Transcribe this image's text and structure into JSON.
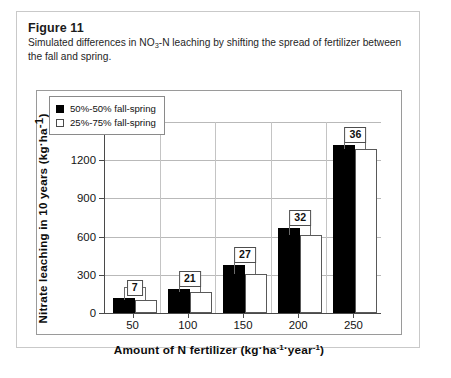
{
  "figure": {
    "title": "Figure 11",
    "caption_pre": "Simulated differences in NO",
    "caption_sub": "3",
    "caption_post": "-N leaching by shifting the spread of fertilizer between the fall and spring."
  },
  "chart_data": {
    "type": "bar",
    "title": "",
    "xlabel": "Amount of N fertilizer (kg·ha⁻¹·year⁻¹)",
    "ylabel": "Nitrate leaching in 10 years (kg·ha⁻¹)",
    "categories": [
      "50",
      "100",
      "150",
      "200",
      "250"
    ],
    "ylim": [
      0,
      1500
    ],
    "yticks": [
      0,
      300,
      600,
      900,
      1200,
      1500
    ],
    "grid": true,
    "legend_position": "upper-left-inside",
    "series": [
      {
        "name": "50%-50% fall-spring",
        "color": "#000000",
        "fill": "solid",
        "values": [
          115,
          185,
          375,
          665,
          1320
        ]
      },
      {
        "name": "25%-75% fall-spring",
        "color": "#ffffff",
        "fill": "open",
        "values": [
          105,
          165,
          305,
          610,
          1290
        ]
      }
    ],
    "difference_labels": [
      "7",
      "21",
      "27",
      "32",
      "36"
    ],
    "annotations": "Boxed numbers show the percent reduction in nitrate leaching when shifting fertilizer spread from 50%-50% to 25%-75% fall-spring."
  },
  "axis_labels": {
    "y": [
      "1500",
      "1200",
      "900",
      "600",
      "300",
      "0"
    ],
    "x": [
      "50",
      "100",
      "150",
      "200",
      "250"
    ]
  },
  "ytitle": {
    "main": "Nitrate leaching in 10 years (kg",
    "dot": "·",
    "unit": "ha",
    "sup": "-1",
    "close": ")"
  },
  "xtitle": {
    "main": "Amount of N fertilizer (kg",
    "dot1": "·",
    "unit1": "ha",
    "sup1": "-1",
    "dot2": "·",
    "unit2": "year",
    "sup2": "-1",
    "close": ")"
  },
  "legend": {
    "items": [
      {
        "label": "50%-50% fall-spring",
        "swatch": "filled-square-icon"
      },
      {
        "label": "25%-75% fall-spring",
        "swatch": "open-square-icon"
      }
    ]
  }
}
